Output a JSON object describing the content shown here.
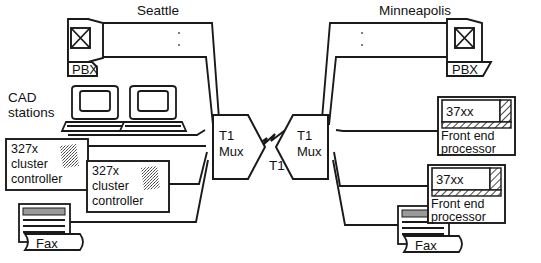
{
  "diagram": {
    "title": "",
    "type": "network-topology",
    "sites": [
      {
        "id": "seattle",
        "label": "Seattle",
        "label_pos": {
          "x": 158,
          "y": 13
        },
        "devices": [
          {
            "name": "pbx",
            "label": "PBX",
            "icon": "crossed-box-icon"
          },
          {
            "name": "cad-stations",
            "label": "CAD\nstations",
            "label_line1": "CAD",
            "label_line2": "stations",
            "icon": "computer-workstation-icon",
            "count": 2
          },
          {
            "name": "cluster-controller-1",
            "label_line1": "327x",
            "label_line2": "cluster",
            "label_line3": "controller",
            "icon": "textured-square-icon"
          },
          {
            "name": "cluster-controller-2",
            "label_line1": "327x",
            "label_line2": "cluster",
            "label_line3": "controller",
            "icon": "textured-square-icon"
          },
          {
            "name": "fax-left",
            "label": "Fax",
            "icon": "fax-machine-icon"
          },
          {
            "name": "mux-left",
            "label_line1": "T1",
            "label_line2": "Mux",
            "icon": "mux-pentagon-icon"
          }
        ]
      },
      {
        "id": "minneapolis",
        "label": "Minneapolis",
        "label_pos": {
          "x": 415,
          "y": 13
        },
        "devices": [
          {
            "name": "pbx",
            "label": "PBX",
            "icon": "crossed-box-icon"
          },
          {
            "name": "front-end-processor-1",
            "label_model": "37xx",
            "label_line1": "Front end",
            "label_line2": "processor",
            "icon": "hatched-cabinet-icon"
          },
          {
            "name": "front-end-processor-2",
            "label_model": "37xx",
            "label_line1": "Front end",
            "label_line2": "processor",
            "icon": "hatched-cabinet-icon"
          },
          {
            "name": "fax-right",
            "label": "Fax",
            "icon": "fax-machine-icon"
          },
          {
            "name": "mux-right",
            "label_line1": "T1",
            "label_line2": "Mux",
            "icon": "mux-pentagon-icon"
          }
        ]
      }
    ],
    "wan_link": {
      "name": "t1-trunk",
      "label": "T1",
      "style": "zigzag",
      "label_pos": {
        "x": 277,
        "y": 167
      }
    },
    "labels": {
      "seattle": "Seattle",
      "minneapolis": "Minneapolis",
      "pbx": "PBX",
      "cad_line1": "CAD",
      "cad_line2": "stations",
      "cc_line1": "327x",
      "cc_line2": "cluster",
      "cc_line3": "controller",
      "fax": "Fax",
      "mux_line1": "T1",
      "mux_line2": "Mux",
      "fep_model": "37xx",
      "fep_line1": "Front end",
      "fep_line2": "processor",
      "t1": "T1"
    },
    "colors": {
      "line": "#1a1a1a",
      "background": "#ffffff",
      "text": "#111111",
      "hatch": "#222222",
      "fax_header": "#808080"
    }
  }
}
